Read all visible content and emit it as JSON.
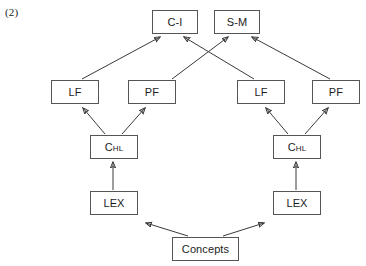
{
  "figure": {
    "label": "(2)",
    "type": "node-link-diagram",
    "background_color": "#ffffff",
    "box_border_color": "#555555",
    "edge_color": "#3a3a3a"
  },
  "nodes": [
    {
      "id": "c-i",
      "label": "C-I",
      "x": 152,
      "y": 10,
      "w": 46,
      "h": 24
    },
    {
      "id": "s-m",
      "label": "S-M",
      "x": 214,
      "y": 10,
      "w": 46,
      "h": 24
    },
    {
      "id": "lf-left",
      "label": "LF",
      "x": 51,
      "y": 80,
      "w": 48,
      "h": 24
    },
    {
      "id": "pf-left",
      "label": "PF",
      "x": 128,
      "y": 80,
      "w": 48,
      "h": 24
    },
    {
      "id": "lf-right",
      "label": "LF",
      "x": 237,
      "y": 80,
      "w": 48,
      "h": 24
    },
    {
      "id": "pf-right",
      "label": "PF",
      "x": 312,
      "y": 80,
      "w": 48,
      "h": 24
    },
    {
      "id": "chl-left",
      "label": "C",
      "sub": "HL",
      "x": 90,
      "y": 135,
      "w": 48,
      "h": 24
    },
    {
      "id": "chl-right",
      "label": "C",
      "sub": "HL",
      "x": 273,
      "y": 135,
      "w": 48,
      "h": 24
    },
    {
      "id": "lex-left",
      "label": "LEX",
      "x": 90,
      "y": 191,
      "w": 48,
      "h": 24
    },
    {
      "id": "lex-right",
      "label": "LEX",
      "x": 273,
      "y": 191,
      "w": 48,
      "h": 24
    },
    {
      "id": "concepts",
      "label": "Concepts",
      "x": 172,
      "y": 237,
      "w": 67,
      "h": 24
    }
  ],
  "edges": [
    {
      "id": "lf-left-to-ci",
      "from": "lf-left",
      "to": "c-i",
      "x1": 82,
      "y1": 79,
      "x2": 160,
      "y2": 37
    },
    {
      "id": "pf-left-to-sm",
      "from": "pf-left",
      "to": "s-m",
      "x1": 172,
      "y1": 79,
      "x2": 228,
      "y2": 37
    },
    {
      "id": "lf-right-to-ci",
      "from": "lf-right",
      "to": "c-i",
      "x1": 254,
      "y1": 79,
      "x2": 184,
      "y2": 37
    },
    {
      "id": "pf-right-to-sm",
      "from": "pf-right",
      "to": "s-m",
      "x1": 330,
      "y1": 79,
      "x2": 252,
      "y2": 37
    },
    {
      "id": "chl-left-to-lf",
      "from": "chl-left",
      "to": "lf-left",
      "x1": 105,
      "y1": 134,
      "x2": 83,
      "y2": 108
    },
    {
      "id": "chl-left-to-pf",
      "from": "chl-left",
      "to": "pf-left",
      "x1": 122,
      "y1": 134,
      "x2": 145,
      "y2": 108
    },
    {
      "id": "chl-right-to-lf",
      "from": "chl-right",
      "to": "lf-right",
      "x1": 288,
      "y1": 134,
      "x2": 266,
      "y2": 108
    },
    {
      "id": "chl-right-to-pf",
      "from": "chl-right",
      "to": "pf-right",
      "x1": 305,
      "y1": 134,
      "x2": 328,
      "y2": 108
    },
    {
      "id": "lex-left-to-chl",
      "from": "lex-left",
      "to": "chl-left",
      "x1": 113,
      "y1": 190,
      "x2": 113,
      "y2": 162
    },
    {
      "id": "lex-right-to-chl",
      "from": "lex-right",
      "to": "chl-right",
      "x1": 296,
      "y1": 190,
      "x2": 296,
      "y2": 162
    },
    {
      "id": "concepts-to-lex-left",
      "from": "concepts",
      "to": "lex-left",
      "x1": 188,
      "y1": 236,
      "x2": 146,
      "y2": 223
    },
    {
      "id": "concepts-to-lex-right",
      "from": "concepts",
      "to": "lex-right",
      "x1": 223,
      "y1": 236,
      "x2": 264,
      "y2": 223
    }
  ]
}
